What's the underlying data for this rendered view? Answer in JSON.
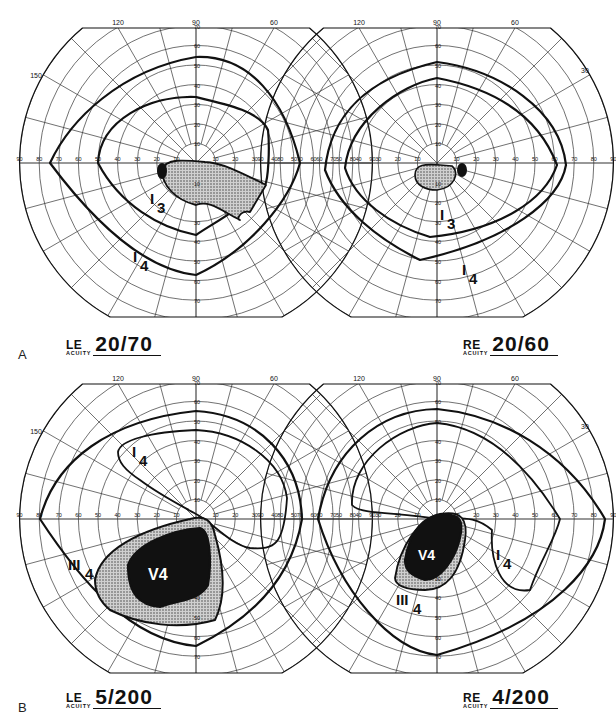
{
  "figure": {
    "caption_partial": "Fig. ... Goldmann visual fields (caption cut off)",
    "scale": {
      "meridian_labels_top": [
        "120",
        "90",
        "60"
      ],
      "meridian_label_150": "150",
      "meridian_label_30": "30",
      "ring_labels": [
        "10",
        "20",
        "30",
        "40",
        "50",
        "60",
        "70",
        "80",
        "90"
      ]
    },
    "panels": [
      {
        "letter": "A",
        "left_eye": {
          "code": "LE",
          "acuity_label": "ACUITY",
          "acuity": "20/70",
          "isopters": [
            {
              "name": "I",
              "sub": "4",
              "type": "outline"
            },
            {
              "name": "I",
              "sub": "3",
              "type": "outline"
            }
          ],
          "scotoma": "dotted central/inferonasal scotoma with dense blind spot"
        },
        "right_eye": {
          "code": "RE",
          "acuity_label": "ACUITY",
          "acuity": "20/60",
          "isopters": [
            {
              "name": "I",
              "sub": "4",
              "type": "outline"
            },
            {
              "name": "I",
              "sub": "3",
              "type": "outline"
            }
          ],
          "scotoma": "small dotted central scotoma with dense blind spot"
        }
      },
      {
        "letter": "B",
        "left_eye": {
          "code": "LE",
          "acuity_label": "ACUITY",
          "acuity": "5/200",
          "isopters": [
            {
              "name": "I",
              "sub": "4",
              "type": "outline"
            },
            {
              "name": "III",
              "sub": "4",
              "type": "dotted"
            },
            {
              "name": "V",
              "sub": "4",
              "type": "solid"
            }
          ]
        },
        "right_eye": {
          "code": "RE",
          "acuity_label": "ACUITY",
          "acuity": "4/200",
          "isopters": [
            {
              "name": "I",
              "sub": "4",
              "type": "outline"
            },
            {
              "name": "III",
              "sub": "4",
              "type": "dotted"
            },
            {
              "name": "V",
              "sub": "4",
              "type": "solid"
            }
          ]
        }
      }
    ],
    "colors": {
      "ink": "#111111",
      "grid": "#333333",
      "paper": "#ffffff",
      "stipple": "#9a9a9a"
    }
  }
}
